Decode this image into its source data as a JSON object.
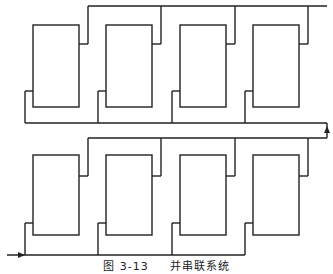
{
  "caption": {
    "figure_label": "图 3-13",
    "title": "并串联系统"
  },
  "diagram": {
    "type": "series-parallel system",
    "line_color": "#222222",
    "background": "#ffffff",
    "rows": [
      {
        "name": "upper-parallel-group",
        "elements": 4,
        "boxes_x": [
          33,
          106,
          180,
          253
        ],
        "box_top": 25,
        "box_bottom": 107,
        "top_bus_y": 6,
        "bottom_bus_y": 123,
        "out_connector_y": 44,
        "in_connector_y": 91
      },
      {
        "name": "lower-parallel-group",
        "elements": 4,
        "boxes_x": [
          33,
          106,
          180,
          253
        ],
        "box_top": 155,
        "box_bottom": 235,
        "top_bus_y": 138,
        "bottom_bus_y": 255,
        "out_connector_y": 176,
        "in_connector_y": 223
      }
    ],
    "box_width": 46,
    "input_arrow": "left-bottom",
    "link_arrow": "right-side-up"
  }
}
